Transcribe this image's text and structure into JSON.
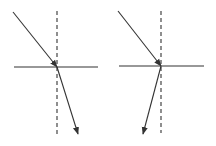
{
  "diagram": {
    "type": "light-refraction",
    "background": "#ffffff",
    "stroke_color": "#333333",
    "panels": [
      {
        "id": "left",
        "interface": {
          "x1": 14,
          "y1": 67,
          "x2": 98,
          "y2": 67
        },
        "normal": {
          "x1": 57,
          "y1": 11,
          "x2": 57,
          "y2": 135,
          "dashed": true
        },
        "incident_ray": {
          "x1": 13,
          "y1": 12,
          "x2": 57,
          "y2": 67,
          "arrow": "end"
        },
        "refracted_ray": {
          "x1": 57,
          "y1": 67,
          "x2": 78,
          "y2": 134,
          "arrow": "end"
        }
      },
      {
        "id": "right",
        "interface": {
          "x1": 119,
          "y1": 66,
          "x2": 204,
          "y2": 66
        },
        "normal": {
          "x1": 161,
          "y1": 11,
          "x2": 161,
          "y2": 133,
          "dashed": true
        },
        "incident_ray": {
          "x1": 118,
          "y1": 11,
          "x2": 161,
          "y2": 66,
          "arrow": "end"
        },
        "refracted_ray": {
          "x1": 161,
          "y1": 66,
          "x2": 143,
          "y2": 134,
          "arrow": "end"
        }
      }
    ]
  }
}
